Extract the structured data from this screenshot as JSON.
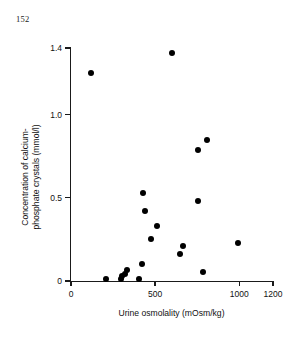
{
  "page": {
    "folio": "152"
  },
  "chart_data": {
    "type": "scatter",
    "title": "",
    "xlabel": "Urine osmolality (mOsm/kg)",
    "ylabel": "Concentration of calcium-phosphate crystals (mmol/l)",
    "ylabel_lines": [
      "Concentration of calcium-",
      "phosphate crystals (mmol/l)"
    ],
    "xlim": [
      0,
      1200
    ],
    "ylim": [
      0,
      1.4
    ],
    "xticks": [
      0,
      500,
      1000,
      1200
    ],
    "xtick_labels": [
      "0",
      "500",
      "1000",
      "1200"
    ],
    "yticks": [
      0,
      0.5,
      1.0,
      1.4
    ],
    "ytick_labels": [
      "0",
      "0.5",
      "1.0",
      "1.4"
    ],
    "grid": false,
    "legend": null,
    "marker": "filled-circle",
    "marker_color": "#000000",
    "points": [
      {
        "x": 120,
        "y": 1.25
      },
      {
        "x": 600,
        "y": 1.37
      },
      {
        "x": 755,
        "y": 0.79
      },
      {
        "x": 805,
        "y": 0.85
      },
      {
        "x": 425,
        "y": 0.53
      },
      {
        "x": 755,
        "y": 0.48
      },
      {
        "x": 440,
        "y": 0.42
      },
      {
        "x": 510,
        "y": 0.33
      },
      {
        "x": 475,
        "y": 0.25
      },
      {
        "x": 995,
        "y": 0.23
      },
      {
        "x": 665,
        "y": 0.21
      },
      {
        "x": 645,
        "y": 0.16
      },
      {
        "x": 420,
        "y": 0.1
      },
      {
        "x": 330,
        "y": 0.065
      },
      {
        "x": 785,
        "y": 0.055
      },
      {
        "x": 318,
        "y": 0.045
      },
      {
        "x": 305,
        "y": 0.03
      },
      {
        "x": 295,
        "y": 0.015
      },
      {
        "x": 210,
        "y": 0.01
      },
      {
        "x": 405,
        "y": 0.01
      }
    ]
  }
}
